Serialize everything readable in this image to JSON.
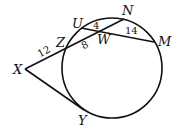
{
  "diagram": {
    "type": "circle-secants-tangent",
    "circle": {
      "cx": 112,
      "cy": 68,
      "r": 50
    },
    "points": {
      "X": {
        "x": 25,
        "y": 69,
        "label": "X"
      },
      "Z": {
        "x": 66,
        "y": 47,
        "label": "Z"
      },
      "Y": {
        "x": 84,
        "y": 110,
        "label": "Y"
      },
      "U": {
        "x": 81,
        "y": 28,
        "label": "U"
      },
      "N": {
        "x": 124,
        "y": 19,
        "label": "N"
      },
      "M": {
        "x": 154,
        "y": 42,
        "label": "M"
      },
      "W": {
        "x": 101,
        "y": 31,
        "label": "W"
      }
    },
    "segments": [
      {
        "from": "X",
        "to": "N",
        "name": "secant-XN"
      },
      {
        "from": "X",
        "to": "Y",
        "name": "tangent-XY"
      },
      {
        "from": "U",
        "to": "M",
        "name": "chord-UM"
      }
    ],
    "measures": {
      "XZ": "12",
      "ZW": "8",
      "UW": "4",
      "WM": "14"
    }
  }
}
